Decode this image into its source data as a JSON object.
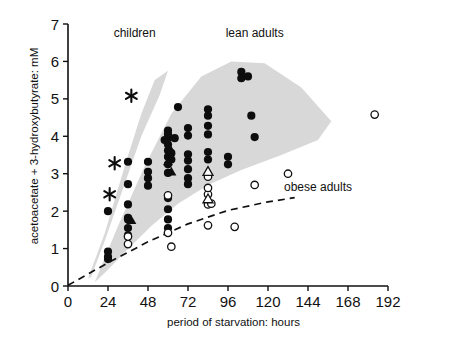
{
  "chart_data": {
    "type": "scatter",
    "title": "",
    "xlabel": "period of starvation: hours",
    "ylabel": "acetoacetate + 3-hydroxybutyrate: mM",
    "xlim": [
      0,
      192
    ],
    "ylim": [
      0,
      7
    ],
    "xticks": [
      0,
      24,
      48,
      72,
      96,
      120,
      144,
      168,
      192
    ],
    "yticks": [
      0,
      1,
      2,
      3,
      4,
      5,
      6,
      7
    ],
    "grid": false,
    "legend_position": "inline-annotations",
    "annotations": [
      {
        "text": "children",
        "x": 40,
        "y": 6.65
      },
      {
        "text": "lean adults",
        "x": 112,
        "y": 6.65
      },
      {
        "text": "obese adults",
        "x": 150,
        "y": 2.55
      }
    ],
    "bands": [
      {
        "name": "children",
        "description": "shaded envelope for children, steep rise",
        "points": [
          [
            12,
            0.2
          ],
          [
            22,
            1.4
          ],
          [
            34,
            3.2
          ],
          [
            44,
            4.6
          ],
          [
            52,
            5.5
          ],
          [
            60,
            5.75
          ],
          [
            55,
            5.1
          ],
          [
            44,
            4.0
          ],
          [
            33,
            2.6
          ],
          [
            22,
            1.2
          ],
          [
            14,
            0.25
          ]
        ]
      },
      {
        "name": "lean adults",
        "description": "shaded envelope for lean adults, broad plateau",
        "points": [
          [
            16,
            0.1
          ],
          [
            30,
            1.6
          ],
          [
            46,
            3.2
          ],
          [
            62,
            4.6
          ],
          [
            80,
            5.6
          ],
          [
            98,
            6.0
          ],
          [
            118,
            5.95
          ],
          [
            140,
            5.3
          ],
          [
            158,
            4.4
          ],
          [
            150,
            3.9
          ],
          [
            128,
            3.5
          ],
          [
            104,
            3.1
          ],
          [
            84,
            2.7
          ],
          [
            66,
            2.2
          ],
          [
            50,
            1.6
          ],
          [
            34,
            0.9
          ],
          [
            22,
            0.35
          ]
        ]
      }
    ],
    "obese_boundary": {
      "name": "obese adults boundary",
      "style": "dashed",
      "points": [
        [
          0,
          0.02
        ],
        [
          24,
          0.62
        ],
        [
          48,
          1.18
        ],
        [
          72,
          1.66
        ],
        [
          96,
          2.02
        ],
        [
          120,
          2.25
        ],
        [
          136,
          2.36
        ]
      ]
    },
    "series": [
      {
        "name": "lean adults and children (filled circles)",
        "marker": "filled-circle",
        "points": [
          [
            24,
            0.92
          ],
          [
            24,
            0.78
          ],
          [
            24,
            0.72
          ],
          [
            24,
            2.0
          ],
          [
            36,
            1.35
          ],
          [
            36,
            1.55
          ],
          [
            36,
            1.78
          ],
          [
            36,
            1.82
          ],
          [
            36,
            2.18
          ],
          [
            36,
            2.72
          ],
          [
            36,
            3.32
          ],
          [
            48,
            2.68
          ],
          [
            48,
            2.88
          ],
          [
            48,
            3.05
          ],
          [
            48,
            3.32
          ],
          [
            60,
            1.55
          ],
          [
            60,
            1.78
          ],
          [
            60,
            2.05
          ],
          [
            60,
            2.35
          ],
          [
            60,
            3.02
          ],
          [
            60,
            3.25
          ],
          [
            60,
            3.45
          ],
          [
            60,
            3.62
          ],
          [
            60,
            3.78
          ],
          [
            60,
            3.95
          ],
          [
            60,
            4.05
          ],
          [
            60,
            4.15
          ],
          [
            62,
            3.55
          ],
          [
            62,
            3.38
          ],
          [
            58,
            3.9
          ],
          [
            64,
            3.95
          ],
          [
            66,
            4.78
          ],
          [
            72,
            2.72
          ],
          [
            72,
            2.88
          ],
          [
            72,
            3.12
          ],
          [
            72,
            3.35
          ],
          [
            72,
            3.52
          ],
          [
            72,
            4.02
          ],
          [
            72,
            4.22
          ],
          [
            84,
            2.95
          ],
          [
            84,
            3.38
          ],
          [
            84,
            3.58
          ],
          [
            84,
            4.05
          ],
          [
            84,
            4.28
          ],
          [
            84,
            4.55
          ],
          [
            84,
            4.72
          ],
          [
            96,
            3.25
          ],
          [
            96,
            3.45
          ],
          [
            104,
            5.55
          ],
          [
            104,
            5.72
          ],
          [
            108,
            5.6
          ],
          [
            110,
            4.55
          ],
          [
            112,
            3.98
          ]
        ]
      },
      {
        "name": "filled triangles",
        "marker": "filled-triangle",
        "points": [
          [
            38,
            1.75
          ],
          [
            60,
            3.32
          ],
          [
            61,
            3.68
          ],
          [
            62,
            3.05
          ]
        ]
      },
      {
        "name": "obese adults (open circles)",
        "marker": "open-circle",
        "points": [
          [
            36,
            1.12
          ],
          [
            36,
            1.32
          ],
          [
            60,
            1.42
          ],
          [
            60,
            2.42
          ],
          [
            62,
            1.05
          ],
          [
            84,
            1.62
          ],
          [
            84,
            2.18
          ],
          [
            84,
            2.45
          ],
          [
            84,
            2.62
          ],
          [
            84,
            2.92
          ],
          [
            86,
            2.2
          ],
          [
            100,
            1.58
          ],
          [
            112,
            2.7
          ],
          [
            132,
            3.0
          ],
          [
            184,
            4.58
          ]
        ]
      },
      {
        "name": "open triangles",
        "marker": "open-triangle",
        "points": [
          [
            84,
            3.05
          ],
          [
            84,
            2.32
          ]
        ]
      },
      {
        "name": "asterisks",
        "marker": "asterisk",
        "points": [
          [
            38,
            5.08
          ],
          [
            28,
            3.28
          ],
          [
            25,
            2.45
          ]
        ]
      }
    ]
  }
}
